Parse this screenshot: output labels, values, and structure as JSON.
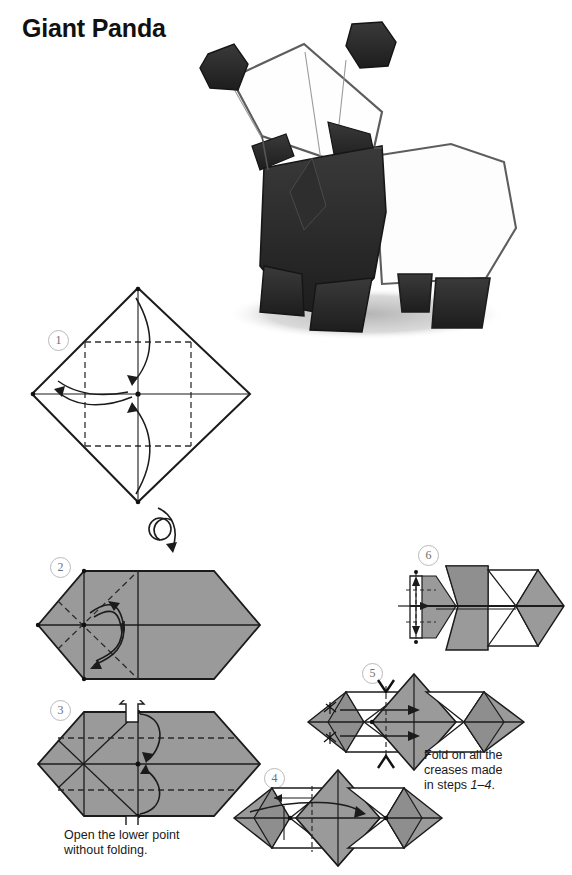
{
  "page": {
    "title": "Giant Panda",
    "background_color": "#ffffff",
    "paper_gray": "#9a9a9a",
    "paper_gray_dark": "#8a8a8a",
    "line_color": "#1a1a1a"
  },
  "photo": {
    "name": "origami-panda-photo",
    "description": "Pencil drawing of a finished folded origami giant panda standing on a shaded ground",
    "body_black": "#2a2a2a",
    "paper_white": "#ffffff",
    "shadow_gray": "#b6b6b6"
  },
  "steps": [
    {
      "number": "1",
      "label": "①",
      "caption": "",
      "shape": "diamond",
      "note": "square rotated 45 degrees, white side up, with dashed inner square creases and curved fold arrows"
    },
    {
      "number": "2",
      "label": "②",
      "caption": "",
      "shape": "hexagon",
      "note": "gray side up after turning over, dashed diagonal creases with two curved arrows"
    },
    {
      "number": "3",
      "label": "③",
      "caption": "Open the lower point\nwithout folding.",
      "caption_line1": "Open the lower point",
      "caption_line2": "without folding.",
      "shape": "hexagon",
      "note": "hollow up and down arrows with two curved arrows on the right of center"
    },
    {
      "number": "4",
      "label": "④",
      "caption": "",
      "shape": "wide-pleated",
      "note": "symmetrical flattened form with gray triangular panels and white pockets"
    },
    {
      "number": "5",
      "label": "⑤",
      "caption": "Fold on all the\ncreases made\nin steps 1–4.",
      "caption_line1": "Fold on all the",
      "caption_line2": "creases made",
      "caption_line3_pre": "in steps ",
      "caption_line3_em": "1–4",
      "caption_line3_post": ".",
      "shape": "wide-pleated",
      "note": "pinch marks top and bottom plus horizontal arrows pointing right"
    },
    {
      "number": "6",
      "label": "⑥",
      "caption": "",
      "shape": "narrowed",
      "note": "left end compressed into narrow pleats, small vertical dashed crease with double arrow"
    }
  ],
  "symbols": {
    "turn_over": "turn-over-arrow",
    "valley_fold": "dashed line",
    "mountain_fold": "solid line",
    "push_open": "hollow arrow",
    "fold_direction": "curved solid arrow"
  }
}
